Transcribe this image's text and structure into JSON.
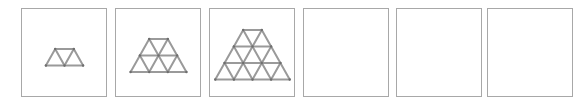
{
  "figure": {
    "type": "matchstick-triangle-pattern",
    "panel_count": 6,
    "stick_color": "#9a9a9a",
    "node_color": "#6e6e6e",
    "border_color": "#a8a8a8",
    "unit_px": 18.6,
    "row_height_px": 16.5,
    "panels": [
      {
        "index": 1,
        "left": 21,
        "rows": 1,
        "top_y": 49,
        "center_x": 64.5,
        "filled": true
      },
      {
        "index": 2,
        "left": 115,
        "rows": 2,
        "top_y": 39,
        "center_x": 158.5,
        "filled": true
      },
      {
        "index": 3,
        "left": 209,
        "rows": 3,
        "top_y": 30,
        "center_x": 252.5,
        "filled": true
      },
      {
        "index": 4,
        "left": 303,
        "rows": 0,
        "filled": false
      },
      {
        "index": 5,
        "left": 396,
        "rows": 0,
        "filled": false
      },
      {
        "index": 6,
        "left": 487,
        "rows": 0,
        "filled": false
      }
    ]
  }
}
